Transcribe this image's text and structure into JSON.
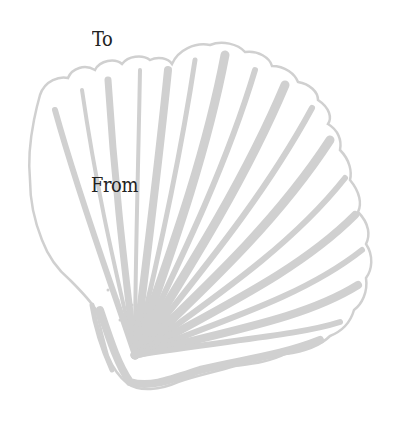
{
  "tag": {
    "to_label": "To",
    "from_label": "From"
  },
  "illustration": {
    "name": "scallop-shell",
    "color": "#d0d0d0",
    "background": "#ffffff"
  },
  "colors": {
    "text": "#222222",
    "shell": "#d0d0d0"
  }
}
